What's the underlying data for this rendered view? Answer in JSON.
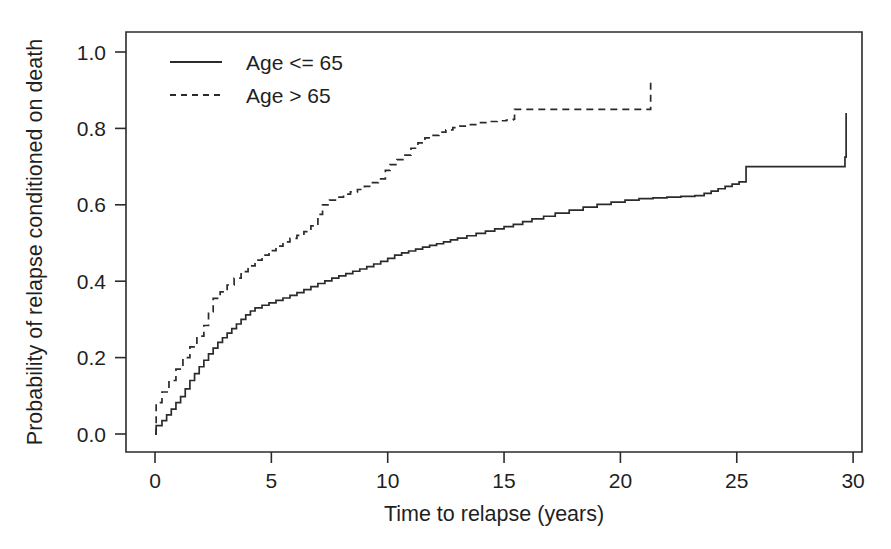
{
  "chart_data": {
    "type": "line",
    "subtype": "step",
    "title": "",
    "xlabel": "Time to relapse (years)",
    "ylabel": "Probability of relapse conditioned on death",
    "xlim": [
      -1.0,
      30.4
    ],
    "ylim": [
      -0.035,
      1.04
    ],
    "xticks": [
      0,
      5,
      10,
      15,
      20,
      25,
      30
    ],
    "xticklabels": [
      "0",
      "5",
      "10",
      "15",
      "20",
      "25",
      "30"
    ],
    "yticks": [
      0.0,
      0.2,
      0.4,
      0.6,
      0.8,
      1.0
    ],
    "yticklabels": [
      "0.0",
      "0.2",
      "0.4",
      "0.6",
      "0.8",
      "1.0"
    ],
    "grid": false,
    "frame": "box",
    "legend_position": "top-left",
    "line_color": "#2b2b2b",
    "background_color": "#ffffff",
    "legend": [
      {
        "name": "Age <= 65",
        "style": "solid"
      },
      {
        "name": "Age > 65",
        "style": "dashed"
      }
    ],
    "series": [
      {
        "name": "Age <= 65",
        "style": "solid",
        "x": [
          0.0,
          0.05,
          0.3,
          0.5,
          0.7,
          0.9,
          1.1,
          1.3,
          1.5,
          1.7,
          1.9,
          2.1,
          2.3,
          2.5,
          2.7,
          2.9,
          3.1,
          3.3,
          3.5,
          3.7,
          3.9,
          4.1,
          4.3,
          4.6,
          4.9,
          5.2,
          5.5,
          5.8,
          6.1,
          6.4,
          6.7,
          7.0,
          7.3,
          7.6,
          7.9,
          8.2,
          8.5,
          8.8,
          9.1,
          9.4,
          9.7,
          10.0,
          10.3,
          10.6,
          10.9,
          11.2,
          11.5,
          11.8,
          12.1,
          12.4,
          12.7,
          13.0,
          13.4,
          13.8,
          14.2,
          14.6,
          15.0,
          15.4,
          15.8,
          16.2,
          16.7,
          17.2,
          17.8,
          18.4,
          19.0,
          19.6,
          20.2,
          20.8,
          21.4,
          22.0,
          22.6,
          23.2,
          23.6,
          23.9,
          24.2,
          24.5,
          24.8,
          25.1,
          25.4,
          27.6,
          29.65,
          29.7
        ],
        "y": [
          0.0,
          0.022,
          0.035,
          0.05,
          0.065,
          0.082,
          0.098,
          0.118,
          0.14,
          0.158,
          0.176,
          0.193,
          0.21,
          0.225,
          0.24,
          0.252,
          0.264,
          0.276,
          0.288,
          0.3,
          0.312,
          0.322,
          0.33,
          0.337,
          0.343,
          0.35,
          0.356,
          0.363,
          0.37,
          0.378,
          0.386,
          0.394,
          0.401,
          0.408,
          0.414,
          0.42,
          0.426,
          0.432,
          0.438,
          0.445,
          0.452,
          0.46,
          0.468,
          0.474,
          0.479,
          0.484,
          0.489,
          0.494,
          0.498,
          0.503,
          0.508,
          0.513,
          0.519,
          0.525,
          0.531,
          0.537,
          0.543,
          0.549,
          0.556,
          0.563,
          0.57,
          0.578,
          0.586,
          0.594,
          0.601,
          0.607,
          0.612,
          0.616,
          0.618,
          0.62,
          0.622,
          0.624,
          0.63,
          0.636,
          0.642,
          0.648,
          0.654,
          0.66,
          0.7,
          0.7,
          0.725,
          0.84
        ],
        "comment": "Cumulative probability of relapse, age <= 65 group. Starts near 0 at t=0, rises steeply to ~0.33 by year 4, then gradually to ~0.62 by year 20, final jump to ~0.84 at ~29.7 years."
      },
      {
        "name": "Age > 65",
        "style": "dashed",
        "x": [
          0.0,
          0.05,
          0.3,
          0.6,
          0.9,
          1.2,
          1.5,
          1.8,
          2.1,
          2.3,
          2.5,
          2.8,
          3.1,
          3.4,
          3.7,
          4.0,
          4.3,
          4.6,
          4.9,
          5.2,
          5.5,
          5.8,
          6.1,
          6.4,
          6.7,
          7.0,
          7.2,
          7.5,
          7.8,
          8.1,
          8.4,
          8.7,
          9.0,
          9.3,
          9.6,
          9.9,
          10.1,
          10.4,
          10.7,
          11.0,
          11.3,
          11.6,
          11.9,
          12.2,
          12.5,
          12.8,
          13.1,
          13.5,
          13.9,
          14.3,
          14.7,
          15.1,
          15.4,
          15.45,
          21.25,
          21.3
        ],
        "y": [
          0.0,
          0.082,
          0.11,
          0.14,
          0.17,
          0.2,
          0.228,
          0.256,
          0.284,
          0.32,
          0.355,
          0.372,
          0.39,
          0.408,
          0.425,
          0.44,
          0.455,
          0.468,
          0.48,
          0.492,
          0.503,
          0.512,
          0.52,
          0.53,
          0.545,
          0.575,
          0.6,
          0.612,
          0.62,
          0.628,
          0.634,
          0.64,
          0.648,
          0.658,
          0.668,
          0.69,
          0.705,
          0.718,
          0.73,
          0.748,
          0.762,
          0.775,
          0.782,
          0.79,
          0.796,
          0.802,
          0.806,
          0.81,
          0.815,
          0.818,
          0.82,
          0.822,
          0.824,
          0.85,
          0.85,
          0.92
        ],
        "comment": "Cumulative probability of relapse, age > 65 group. Jumps to ~0.08 at t=0, rises faster than the younger group, plateaus at ~0.85 from ~15.4 to ~21.3 years then jumps to ~0.92 at the end of follow-up."
      }
    ]
  },
  "axis": {
    "x_title": "Time to relapse (years)",
    "y_title": "Probability of relapse conditioned on death"
  }
}
